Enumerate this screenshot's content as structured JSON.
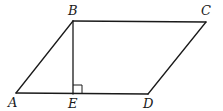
{
  "diagram": {
    "type": "geometry",
    "shape": "parallelogram",
    "vertices": {
      "A": {
        "label": "A",
        "x": 16,
        "y": 93
      },
      "B": {
        "label": "B",
        "x": 73,
        "y": 21
      },
      "C": {
        "label": "C",
        "x": 206,
        "y": 22
      },
      "D": {
        "label": "D",
        "x": 148,
        "y": 94
      },
      "E": {
        "label": "E",
        "x": 73,
        "y": 94
      }
    },
    "edges": [
      {
        "from": "A",
        "to": "B"
      },
      {
        "from": "B",
        "to": "C"
      },
      {
        "from": "C",
        "to": "D"
      },
      {
        "from": "D",
        "to": "A"
      },
      {
        "from": "B",
        "to": "E",
        "note": "altitude"
      }
    ],
    "annotations": [
      {
        "type": "right-angle",
        "at": "E"
      }
    ],
    "labels": {
      "A": "A",
      "B": "B",
      "C": "C",
      "D": "D",
      "E": "E"
    }
  }
}
